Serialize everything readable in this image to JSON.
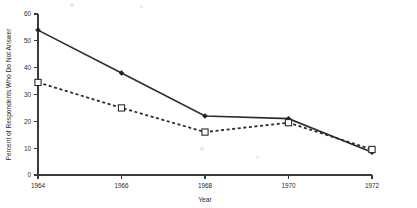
{
  "chart_data": {
    "type": "line",
    "title": "",
    "subtitle": "",
    "xlabel": "Year",
    "ylabel": "Percent of Respondents Who Do Not Answer",
    "x": [
      1964,
      1966,
      1968,
      1970,
      1972
    ],
    "categories": [
      "1964",
      "1966",
      "1968",
      "1970",
      "1972"
    ],
    "xlim": [
      1964,
      1972
    ],
    "ylim": [
      0,
      60
    ],
    "xticks": [
      "1964",
      "1966",
      "1968",
      "1970",
      "1972"
    ],
    "yticks": [
      "0",
      "10",
      "20",
      "30",
      "40",
      "50",
      "60"
    ],
    "grid": false,
    "legend": "none",
    "series": [
      {
        "name": "solid-line-series",
        "style": "solid",
        "marker": "filled-diamond",
        "color": "#2c2c2c",
        "values": [
          54,
          38,
          22,
          21,
          8.5
        ]
      },
      {
        "name": "dashed-line-series",
        "style": "dashed",
        "marker": "open-square",
        "color": "#2c2c2c",
        "values": [
          34.5,
          25,
          16,
          19.5,
          9.5
        ]
      }
    ]
  },
  "axes": {
    "y_axis_label": "Percent of Respondents Who Do Not Answer",
    "x_axis_label": "Year"
  }
}
